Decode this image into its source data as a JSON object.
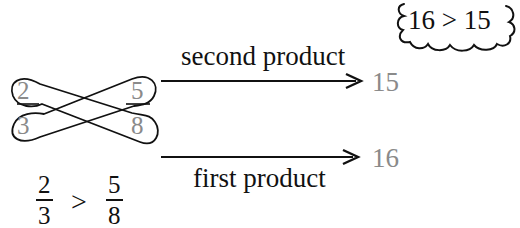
{
  "diagram": {
    "cross_fractions": {
      "left": {
        "numerator": "2",
        "denominator": "3"
      },
      "right": {
        "numerator": "5",
        "denominator": "8"
      }
    },
    "arrows": {
      "top": {
        "label": "second product",
        "result": "15"
      },
      "bottom": {
        "label": "first product",
        "result": "16"
      }
    },
    "cloud": {
      "text": "16 > 15",
      "left_value": "16",
      "operator": ">",
      "right_value": "15"
    },
    "conclusion": {
      "left": {
        "numerator": "2",
        "denominator": "3"
      },
      "operator": ">",
      "right": {
        "numerator": "5",
        "denominator": "8"
      }
    },
    "colors": {
      "ink": "#111111",
      "grey_numbers": "#8a8a8a",
      "background": "#ffffff"
    }
  }
}
